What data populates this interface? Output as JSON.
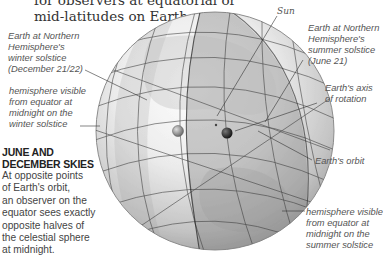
{
  "intro": {
    "line1": "for observers at equatorial or",
    "line2": "mid-latitudes on Earth."
  },
  "labels": {
    "winter_earth": [
      "Earth at Northern",
      "Hemisphere's",
      "winter solstice",
      "(December 21/22)"
    ],
    "winter_hemisphere": [
      "hemisphere visible",
      "from equator at",
      "midnight on the",
      "winter solstice"
    ],
    "sun": "Sun",
    "summer_earth": [
      "Earth at Northern",
      "Hemisphere's",
      "summer solstice",
      "(June 21)"
    ],
    "axis": [
      "Earth's axis",
      "of rotation"
    ],
    "orbit": "Earth's orbit",
    "summer_hemisphere": [
      "hemisphere visible",
      "from equator at",
      "midnight on the",
      "summer solstice"
    ]
  },
  "sidebar": {
    "title": [
      "JUNE AND",
      "DECEMBER SKIES"
    ],
    "body": [
      "At opposite points",
      "of Earth's orbit,",
      "an observer on the",
      "equator sees exactly",
      "opposite halves of",
      "the celestial sphere",
      "at midnight."
    ]
  },
  "colors": {
    "sphere_light": "#f4f4f4",
    "sphere_mid": "#c8c8c8",
    "sphere_dark": "#8a8a8a",
    "grid_line": "#3a3a3a",
    "hemisphere_band": "#7a7a7a",
    "label_text": "#555555"
  }
}
